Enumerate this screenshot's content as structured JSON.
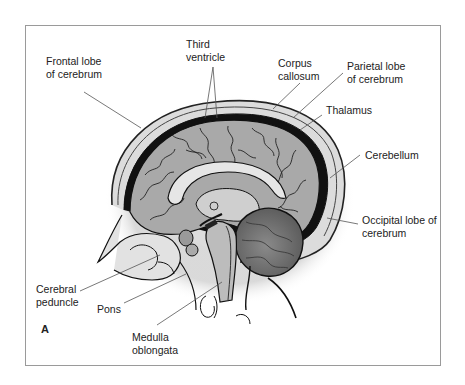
{
  "figure": {
    "panel_letter": "A"
  },
  "labels": {
    "frontal_lobe": [
      "Frontal lobe",
      "of cerebrum"
    ],
    "third_ventricle": [
      "Third",
      "ventricle"
    ],
    "corpus_callosum": [
      "Corpus",
      "callosum"
    ],
    "parietal_lobe": [
      "Parietal lobe",
      "of cerebrum"
    ],
    "thalamus": [
      "Thalamus"
    ],
    "cerebellum": [
      "Cerebellum"
    ],
    "occipital_lobe": [
      "Occipital lobe of",
      "cerebrum"
    ],
    "cerebral_peduncle": [
      "Cerebral",
      "peduncle"
    ],
    "pons": [
      "Pons"
    ],
    "medulla_oblongata": [
      "Medulla",
      "oblongata"
    ]
  },
  "colors": {
    "frame": "#9a9a9a",
    "cortex": "#a9a9a9",
    "cerebellum": "#7a7a7a",
    "outline": "#111111",
    "skull": "#d8d8d8",
    "leader": "#555555"
  }
}
